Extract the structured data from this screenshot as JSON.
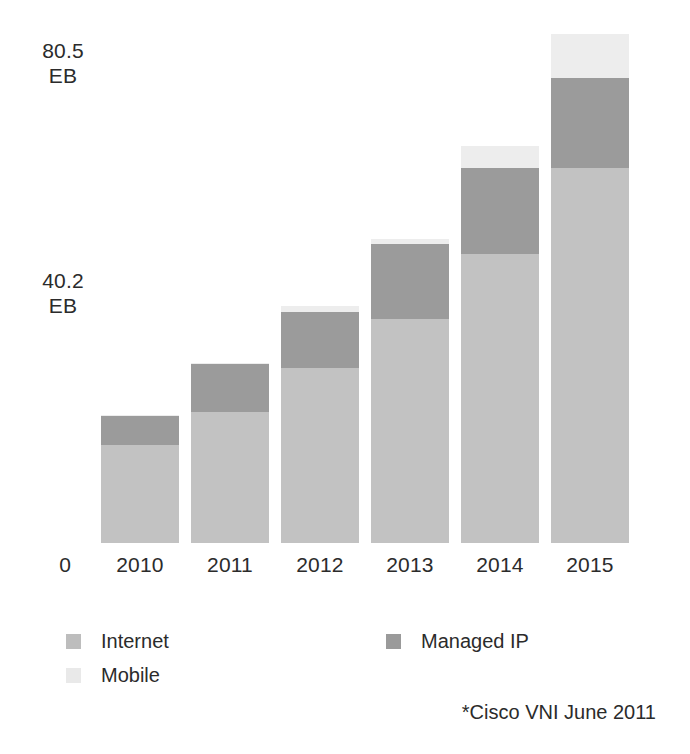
{
  "axis": {
    "y_top_value": "80.5",
    "y_top_unit": "EB",
    "y_mid_value": "40.2",
    "y_mid_unit": "EB",
    "y_zero": "0"
  },
  "legend": {
    "items": [
      {
        "label": "Internet",
        "color": "#bdbdbd",
        "key": "internet"
      },
      {
        "label": "Mobile",
        "color": "#e9e9e9",
        "key": "mobile"
      },
      {
        "label": "Managed IP",
        "color": "#9a9a9a",
        "key": "managed_ip"
      }
    ]
  },
  "source_note": "*Cisco VNI June 2011",
  "chart_data": {
    "type": "bar",
    "stacked": true,
    "title": "",
    "subtitle": "",
    "xlabel": "",
    "ylabel": "EB",
    "categories": [
      "2010",
      "2011",
      "2012",
      "2013",
      "2014",
      "2015"
    ],
    "ylim": [
      0,
      80.5
    ],
    "yticks": [
      0,
      40.2,
      80.5
    ],
    "ytick_labels": [
      "0",
      "40.2 EB",
      "80.5 EB"
    ],
    "grid": false,
    "legend_position": "bottom-left",
    "units": "Exabytes per month (EB)",
    "series": [
      {
        "name": "Internet",
        "color": "#c2c2c2",
        "values": [
          15.7,
          21.0,
          28.0,
          35.9,
          46.2,
          60.0
        ]
      },
      {
        "name": "Managed IP",
        "color": "#9b9b9b",
        "values": [
          4.7,
          7.7,
          9.0,
          12.0,
          13.8,
          14.5
        ]
      },
      {
        "name": "Mobile",
        "color": "#ededed",
        "values": [
          0.1,
          0.1,
          1.0,
          0.7,
          3.5,
          6.9
        ]
      }
    ],
    "totals": [
      20.5,
      28.8,
      38.0,
      48.6,
      63.5,
      81.4
    ],
    "stack_order": [
      "Internet",
      "Managed IP",
      "Mobile"
    ],
    "annotations": [
      "*Cisco VNI June 2011"
    ]
  }
}
